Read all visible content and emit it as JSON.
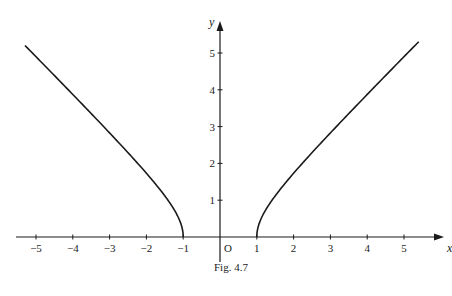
{
  "chart_data": {
    "type": "line",
    "title": "",
    "caption": "Fig. 4.7",
    "xlabel": "x",
    "ylabel": "y",
    "origin_label": "O",
    "xlim": [
      -5.3,
      5.7
    ],
    "ylim": [
      0,
      5.5
    ],
    "grid": false,
    "x_ticks": [
      -5,
      -4,
      -3,
      -2,
      -1,
      1,
      2,
      3,
      4,
      5
    ],
    "x_tick_labels": [
      "−5",
      "−4",
      "−3",
      "−2",
      "−1",
      "1",
      "2",
      "3",
      "4",
      "5"
    ],
    "y_ticks": [
      1,
      2,
      3,
      4,
      5
    ],
    "y_tick_labels": [
      "1",
      "2",
      "3",
      "4",
      "5"
    ],
    "series": [
      {
        "name": "left branch",
        "function": "y = sqrt(x^2 - 1), x <= -1",
        "x": [
          -5.3,
          -5,
          -4,
          -3,
          -2,
          -1.5,
          -1.2,
          -1.05,
          -1
        ],
        "values": [
          5.2,
          4.9,
          3.87,
          2.83,
          1.73,
          1.12,
          0.66,
          0.32,
          0
        ]
      },
      {
        "name": "right branch",
        "function": "y = sqrt(x^2 - 1), x >= 1",
        "x": [
          1,
          1.05,
          1.2,
          1.5,
          2,
          3,
          4,
          5,
          5.4
        ],
        "values": [
          0,
          0.32,
          0.66,
          1.12,
          1.73,
          2.83,
          3.87,
          4.9,
          5.31
        ]
      }
    ],
    "colors": {
      "curve": "#1a1a1a",
      "axis": "#1a1a1a"
    }
  }
}
